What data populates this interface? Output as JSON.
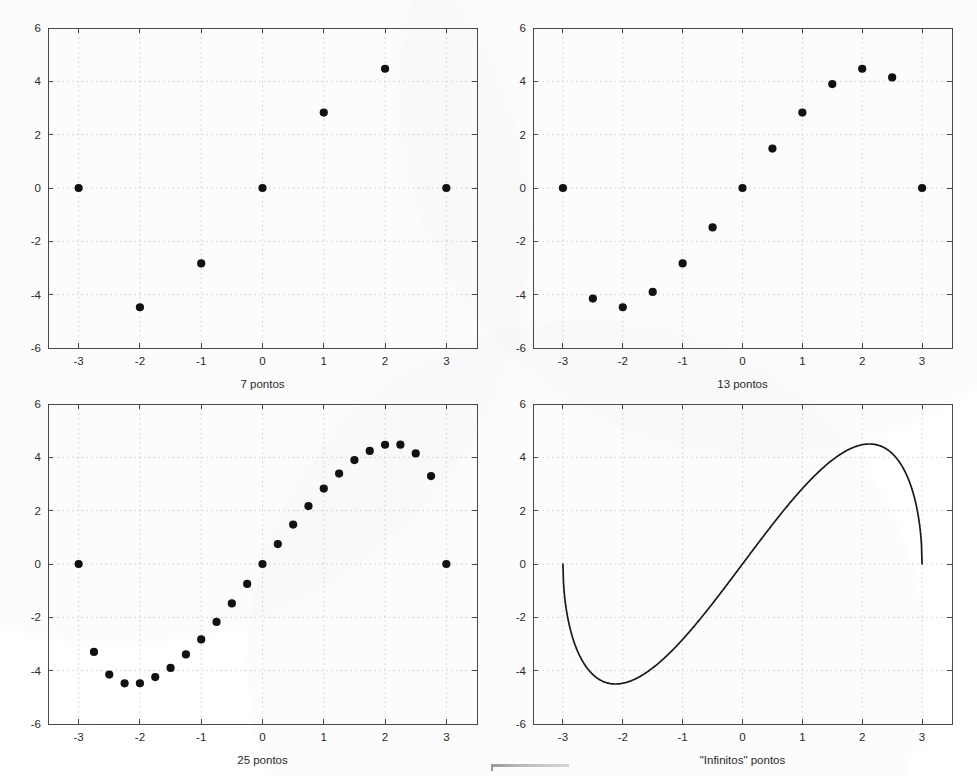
{
  "figure": {
    "caption_language": "pt-BR",
    "background_color": "#ffffff",
    "axis_color": "#4a4a4a",
    "grid_color": "#c8c8c8",
    "marker_color": "#111111",
    "curve_color": "#1a1a1a",
    "layout": "2x2 subplot grid",
    "function_expression": "f(x) = x * sqrt(9 - x^2)"
  },
  "chart_data": [
    {
      "id": "panel-1",
      "type": "scatter",
      "title": "",
      "xlabel": "7 pontos",
      "ylabel": "",
      "xlim": [
        -3.5,
        3.5
      ],
      "ylim": [
        -6,
        6
      ],
      "xticks": [
        -3,
        -2,
        -1,
        0,
        1,
        2,
        3
      ],
      "xticklabels": [
        "-3",
        "-2",
        "-1",
        "0",
        "1",
        "2",
        "3"
      ],
      "yticks": [
        -6,
        -4,
        -2,
        0,
        2,
        4,
        6
      ],
      "yticklabels": [
        "-6",
        "-4",
        "-2",
        "0",
        "2",
        "4",
        "6"
      ],
      "grid": true,
      "legend": null,
      "x": [
        -3,
        -2,
        -1,
        0,
        1,
        2,
        3
      ],
      "values": [
        0,
        -4.472,
        -2.828,
        0,
        2.828,
        4.472,
        0
      ]
    },
    {
      "id": "panel-2",
      "type": "scatter",
      "title": "",
      "xlabel": "13 pontos",
      "ylabel": "",
      "xlim": [
        -3.5,
        3.5
      ],
      "ylim": [
        -6,
        6
      ],
      "xticks": [
        -3,
        -2,
        -1,
        0,
        1,
        2,
        3
      ],
      "xticklabels": [
        "-3",
        "-2",
        "-1",
        "0",
        "1",
        "2",
        "3"
      ],
      "yticks": [
        -6,
        -4,
        -2,
        0,
        2,
        4,
        6
      ],
      "yticklabels": [
        "-6",
        "-4",
        "-2",
        "0",
        "2",
        "4",
        "6"
      ],
      "grid": true,
      "legend": null,
      "x": [
        -3,
        -2.5,
        -2,
        -1.5,
        -1,
        -0.5,
        0,
        0.5,
        1,
        1.5,
        2,
        2.5,
        3
      ],
      "values": [
        0,
        -4.146,
        -4.472,
        -3.897,
        -2.828,
        -1.479,
        0,
        1.479,
        2.828,
        3.897,
        4.472,
        4.146,
        0
      ]
    },
    {
      "id": "panel-3",
      "type": "scatter",
      "title": "",
      "xlabel": "25 pontos",
      "ylabel": "",
      "xlim": [
        -3.5,
        3.5
      ],
      "ylim": [
        -6,
        6
      ],
      "xticks": [
        -3,
        -2,
        -1,
        0,
        1,
        2,
        3
      ],
      "xticklabels": [
        "-3",
        "-2",
        "-1",
        "0",
        "1",
        "2",
        "3"
      ],
      "yticks": [
        -6,
        -4,
        -2,
        0,
        2,
        4,
        6
      ],
      "yticklabels": [
        "-6",
        "-4",
        "-2",
        "0",
        "2",
        "4",
        "6"
      ],
      "grid": true,
      "legend": null,
      "x": [
        -3,
        -2.75,
        -2.5,
        -2.25,
        -2,
        -1.75,
        -1.5,
        -1.25,
        -1,
        -0.75,
        -0.5,
        -0.25,
        0,
        0.25,
        0.5,
        0.75,
        1,
        1.25,
        1.5,
        1.75,
        2,
        2.25,
        2.5,
        2.75,
        3
      ],
      "values": [
        0,
        -3.297,
        -4.146,
        -4.473,
        -4.472,
        -4.241,
        -3.897,
        -3.391,
        -2.828,
        -2.173,
        -1.479,
        -0.747,
        0,
        0.747,
        1.479,
        2.173,
        2.828,
        3.391,
        3.897,
        4.241,
        4.472,
        4.473,
        4.146,
        3.297,
        0
      ]
    },
    {
      "id": "panel-4",
      "type": "line",
      "title": "",
      "xlabel": "\"Infinitos\" pontos",
      "ylabel": "",
      "xlim": [
        -3.5,
        3.5
      ],
      "ylim": [
        -6,
        6
      ],
      "xticks": [
        -3,
        -2,
        -1,
        0,
        1,
        2,
        3
      ],
      "xticklabels": [
        "-3",
        "-2",
        "-1",
        "0",
        "1",
        "2",
        "3"
      ],
      "yticks": [
        -6,
        -4,
        -2,
        0,
        2,
        4,
        6
      ],
      "yticklabels": [
        "-6",
        "-4",
        "-2",
        "0",
        "2",
        "4",
        "6"
      ],
      "grid": true,
      "legend": null,
      "x_range": [
        -3,
        3
      ],
      "samples": 601,
      "peak": {
        "x": 2.121,
        "y": 4.5
      },
      "trough": {
        "x": -2.121,
        "y": -4.5
      }
    }
  ]
}
